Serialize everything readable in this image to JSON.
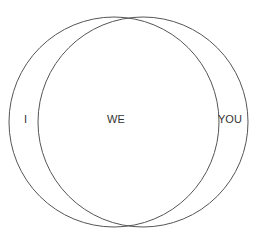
{
  "diagram": {
    "type": "venn",
    "stroke_color": "#555555",
    "background": "#ffffff",
    "circles": [
      {
        "name": "I",
        "cx": 114,
        "cy": 122,
        "r": 105
      },
      {
        "name": "YOU",
        "cx": 143,
        "cy": 122,
        "r": 105
      }
    ],
    "labels": {
      "left": "I",
      "center": "WE",
      "right": "YOU"
    }
  }
}
